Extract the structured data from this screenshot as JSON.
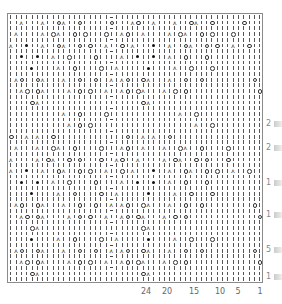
{
  "chart_title": "Knitting lace chart",
  "legend": {
    "|": "knit",
    "-": "purl",
    "O": "yarn over",
    "A": "decrease",
    "*": "bobble"
  },
  "grid": {
    "cols": 48,
    "rows": [
      "|||||||||||||||||||-|||||||||||||||||||||||||||||",
      "||A|||A||OA||O|||||O|||AO||A|||A||OA||O|||||O|||",
      "|||||||||||||||||||-||||||||||||||||||||||||||||",
      "|A||||A|OA||O|O|||O||AO||A||||A|OA||O|O|||O|||||",
      "|||||||||||||||||||-||||||||||||||||||||||||||||",
      "A||*||A||OA||O|O||A||O|A|||*||A||OA||O|O||A||O|",
      "|||||||||||||||||||-||||||||||||||||||||||||||||",
      "||*||*||A||O||||O||||A||*||*||A||O|||O|||||||||",
      "|||||||||||||||||||-||||||||||||||||||||||||||||",
      "||||*||||A||O||||O||A|||||*||||A||O|||O||||||||",
      "|||||||||||||||||||-||||||||||||||||||||||||||||",
      "|AO||OA|||A||O||O||A|AO||OA|||A||O||O|||||||||O|",
      "|||||||||||||||||||-||||||||||||||||||||||||||||",
      "||AO|OA||||A|O|O||A||AO|OA|||A|O|O|||||||||||||O",
      "|||||||||||||||||||-||||||||||||||||||||||||||||",
      "||||OA|||||||||||||||||||OA|||||||||||||||||||||",
      "|||||||||||||||||||-||||||||||||||||||||||||||||",
      "||||||||||A||O||||O|||||||||||||A||O|||||||||||",
      "|||||||||||||||||||-||||||||||||||||||||||||||||",
      "|||||||||||A|O|O|||||||||||||||||||A||O|||||||||",
      "|||||||||||||||||||-||||||||||||||||||||||||||||",
      "O||A|A||O|||||||||||||O||A|A||O||||||||||||||||",
      "|||||||||||||||||||-||||||||||||||||||||||||||||",
      "|A|||A||OA||O||||O|||AO||A|||A||OA||O||||O|||||",
      "|||||||||||||||||||-||||||||||||||||||||||||||||",
      "A||||A|OA||O|O|||O||AO||A||||A|OA||O|O|||O|||||",
      "|||||||||||||||||||-||||||||||||||||||||||||||||",
      "A||*||A||OA||O|O||A||O|A|||*||A||OA||O|O||A||O|",
      "|||||||||||||||||||-||||||||||||||||||||||||||||",
      "||*||*||A||O||||O||||A||*||*||A||O|||O|||||||||",
      "|||||||||||||||||||-||||||||||||||||||||||||||||",
      "||||*||||A||O||||O||A|||||*||||A||O|||O||||||||",
      "|||||||||||||||||||-||||||||||||||||||||||||||||",
      "|AO||OA|||A||O||O||A|AO||OA|||A||O||O|||||||||O|",
      "|||||||||||||||||||-||||||||||||||||||||||||||||",
      "||AO|OA||||A|O|O||A||AO|OA|||A|O|O|||||||||||||O",
      "|||||||||||||||||||-||||||||||||||||||||||||||||",
      "||||OA|||||||||||||||||||OA|||||||||||||||||||||",
      "|||||||||||||||||||-||||||||||||||||||||||||||||",
      "||||*||||A||O||||O||A|||||*||||A||O|||O||||||||",
      "|||||||||||||||||||-||||||||||||||||||||||||||||",
      "|AO||OA|||A||O||O||A|AO||OA|||A||O||O|||||||||O|",
      "|||||||||||||||||||-||||||||||||||||||||||||||||",
      "||AO|OA||||A|O|O||A||AO|OA|||A|O|O|||||||||||||O",
      "|||||||||||||||||||-||||||||||||||||||||||||||||",
      "||||OA|||||||||||||||||||OA|||||||||||||||||||||",
      "|||||||||||||||||||||||||||||||||||||||||||||||"
    ]
  },
  "x_axis": {
    "labels": [
      {
        "text": "24",
        "x": 146
      },
      {
        "text": "20",
        "x": 167
      },
      {
        "text": "15",
        "x": 194
      },
      {
        "text": "10",
        "x": 220
      },
      {
        "text": "5",
        "x": 238
      },
      {
        "text": "1",
        "x": 260
      }
    ]
  },
  "y_axis": {
    "labels": [
      {
        "text": "2",
        "y": 124
      },
      {
        "text": "2",
        "y": 148
      },
      {
        "text": "1",
        "y": 183
      },
      {
        "text": "1",
        "y": 215
      },
      {
        "text": "5",
        "y": 250
      },
      {
        "text": "1",
        "y": 277
      }
    ]
  }
}
